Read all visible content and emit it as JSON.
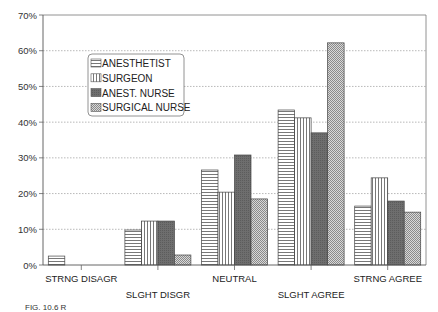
{
  "chart_data": {
    "type": "bar",
    "title": "",
    "xlabel": "",
    "ylabel": "",
    "ylim": [
      0,
      70
    ],
    "yticks": [
      "0%",
      "10%",
      "20%",
      "30%",
      "40%",
      "50%",
      "60%",
      "70%"
    ],
    "grid": true,
    "legend_position": "upper-left inside",
    "categories": [
      "STRNG DISAGR",
      "SLGHT DISGR",
      "NEUTRAL",
      "SLGHT AGREE",
      "STRNG AGREE"
    ],
    "series": [
      {
        "name": "ANESTHETIST",
        "pattern": "horizontal-lines",
        "values": [
          2.5,
          9.8,
          26.6,
          43.4,
          16.5
        ]
      },
      {
        "name": "SURGEON",
        "pattern": "vertical-lines",
        "values": [
          0,
          12.3,
          20.4,
          41.2,
          24.4
        ]
      },
      {
        "name": "ANEST. NURSE",
        "pattern": "dark-solid",
        "values": [
          0,
          12.3,
          30.8,
          37.0,
          17.9
        ]
      },
      {
        "name": "SURGICAL NURSE",
        "pattern": "checker",
        "values": [
          0,
          2.8,
          18.5,
          62.2,
          14.8
        ]
      }
    ]
  },
  "caption": "FIG. 10.6   R"
}
